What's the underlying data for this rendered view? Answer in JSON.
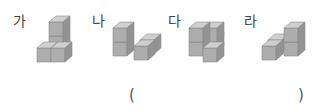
{
  "options": [
    {
      "label": "가",
      "id": "ga"
    },
    {
      "label": "나",
      "id": "na"
    },
    {
      "label": "다",
      "id": "da"
    },
    {
      "label": "라",
      "id": "ra"
    }
  ],
  "answer": {
    "open": "(",
    "close": ")",
    "value": ""
  },
  "colors": {
    "top": "#cfcfcf",
    "front": "#adadad",
    "side": "#939393",
    "edge": "#7a7a7a"
  }
}
